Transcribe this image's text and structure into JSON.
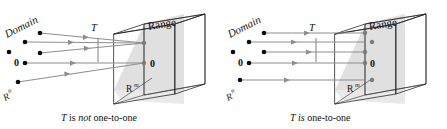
{
  "figure": {
    "panels": [
      {
        "id": "left",
        "caption_parts": [
          "T",
          " is ",
          "not",
          " one-to-one"
        ],
        "caption_text": "T is not one-to-one",
        "domain_label": "Domain",
        "range_label": "Range",
        "transform_label": "T",
        "domain_space_label": "R",
        "domain_space_sup": "n",
        "codomain_space_label": "R",
        "codomain_space_sup": "m",
        "zero_domain_label": "0",
        "zero_range_label": "0",
        "mapping": "many-to-one",
        "source_point_count": 5,
        "image_point_count": 2
      },
      {
        "id": "right",
        "caption_parts": [
          "T",
          " ",
          "is",
          " one-to-one"
        ],
        "caption_text": "T is one-to-one",
        "domain_label": "Domain",
        "range_label": "Range",
        "transform_label": "T",
        "domain_space_label": "R",
        "domain_space_sup": "n",
        "codomain_space_label": "R",
        "codomain_space_sup": "m",
        "zero_domain_label": "0",
        "zero_range_label": "0",
        "mapping": "one-to-one",
        "source_point_count": 5,
        "image_point_count": 5
      }
    ]
  },
  "colors": {
    "ink": "#111111",
    "wire": "#1d1d1d",
    "ray": "#8e8e8e",
    "source_dot": "#0d0d0d",
    "image_dot": "#7b7b7b",
    "plane_fill": "#d4d4d4",
    "background": "#ffffff"
  }
}
